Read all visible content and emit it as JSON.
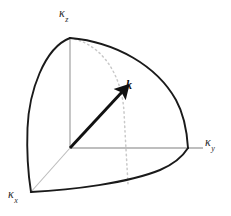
{
  "figure": {
    "background_color": "#ffffff",
    "axes": [
      {
        "id": "z",
        "name": "kappa-z-axis",
        "symbol": "κ",
        "subscript": "z",
        "label": "κz",
        "direction": "up",
        "line_color": "#a8a8a8",
        "origin": [
          70,
          148
        ],
        "end": [
          70,
          38
        ]
      },
      {
        "id": "y",
        "name": "kappa-y-axis",
        "symbol": "κ",
        "subscript": "y",
        "label": "κy",
        "direction": "right",
        "line_color": "#a8a8a8",
        "origin": [
          70,
          148
        ],
        "end": [
          203,
          148
        ]
      },
      {
        "id": "x",
        "name": "kappa-x-axis",
        "symbol": "κ",
        "subscript": "x",
        "label": "κx",
        "direction": "down-left",
        "line_color": "#b4b4b4",
        "origin": [
          70,
          148
        ],
        "end": [
          31,
          192
        ]
      }
    ],
    "vector": {
      "name": "wave-vector-k",
      "label": "k",
      "style": "bold-italic",
      "color": "#111111",
      "tail": [
        70,
        148
      ],
      "head": [
        126,
        88
      ],
      "label_position": [
        126,
        79
      ]
    },
    "octant": {
      "name": "sphere-octant-outline",
      "stroke_color": "#1a1a1a",
      "stroke_width": 1.9,
      "pole_point": [
        70,
        38
      ],
      "x_axis_point": [
        31,
        192
      ],
      "y_axis_point": [
        188,
        148
      ],
      "description": "one-eighth spherical surface bounded by three great-circle arcs"
    },
    "meridian": {
      "name": "dotted-meridian-arc",
      "stroke_color": "#c9c9c9",
      "stroke_width": 1.4,
      "dash": "1.4 3.2",
      "start": [
        70,
        38
      ],
      "end": [
        128,
        184
      ]
    }
  }
}
